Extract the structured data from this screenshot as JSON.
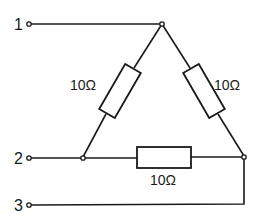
{
  "diagram": {
    "type": "delta (triangle) resistor network",
    "terminals": [
      {
        "id": "t1",
        "label": "1"
      },
      {
        "id": "t2",
        "label": "2"
      },
      {
        "id": "t3",
        "label": "3"
      }
    ],
    "resistors": [
      {
        "id": "r-left",
        "label": "10Ω",
        "between": [
          "top-node",
          "left-node"
        ]
      },
      {
        "id": "r-right",
        "label": "10Ω",
        "between": [
          "top-node",
          "right-node"
        ]
      },
      {
        "id": "r-bottom",
        "label": "10Ω",
        "between": [
          "left-node",
          "right-node"
        ]
      }
    ],
    "connections": [
      "terminal 1 → top node",
      "terminal 2 → left node",
      "terminal 3 → right node"
    ],
    "colors": {
      "line": "#1a1a1a",
      "background": "#ffffff"
    }
  }
}
